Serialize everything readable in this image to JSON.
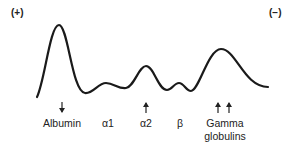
{
  "poles": {
    "positive": "(+)",
    "negative": "(−)"
  },
  "fractions": [
    {
      "label": "Albumin",
      "arrow": "down"
    },
    {
      "label": "α1",
      "arrow": "none"
    },
    {
      "label": "α2",
      "arrow": "up"
    },
    {
      "label": "β",
      "arrow": "none"
    },
    {
      "label": "Gamma",
      "label2": "globulins",
      "arrow": "up-double"
    }
  ],
  "colors": {
    "line": "#1a1a1a",
    "background": "#ffffff"
  }
}
